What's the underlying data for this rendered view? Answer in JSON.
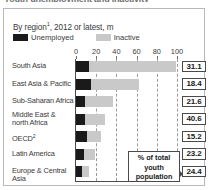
{
  "headline": "Youth unemployment and inactivity",
  "subtitle_prefix": "By region",
  "subtitle_footnote": "1",
  "subtitle_suffix": ", 2012 or latest, m",
  "legend": {
    "unemployed_label": "Unemployed",
    "inactive_label": "Inactive"
  },
  "callout": {
    "line1": "% of total",
    "line2": "youth",
    "line3": "population"
  },
  "colors": {
    "unemployed": "#1a1a1a",
    "inactive": "#c9c9c9",
    "axis": "#4a4a4a",
    "grid": "#9a9a9a",
    "panel_border": "#b9b9b9"
  },
  "chart_data": {
    "type": "bar",
    "orientation": "horizontal",
    "stacked": true,
    "title": "Youth unemployment and inactivity",
    "subtitle": "By region¹, 2012 or latest, m",
    "xlabel": "",
    "ylabel": "",
    "xlim": [
      0,
      100
    ],
    "xticks": [
      0,
      20,
      40,
      60,
      80,
      100
    ],
    "tick_labels": [
      "0",
      "20",
      "40",
      "60",
      "80",
      "100"
    ],
    "grid": true,
    "legend_position": "top-left",
    "categories": [
      "South Asia",
      "East Asia & Pacific",
      "Sub-Saharan Africa",
      "Middle East & north Africa",
      "OECD²",
      "Latin America",
      "Europe & Central Asia"
    ],
    "series": [
      {
        "name": "Unemployed",
        "values": [
          13,
          15,
          9,
          9,
          11,
          8,
          6
        ]
      },
      {
        "name": "Inactive",
        "values": [
          86,
          47,
          28,
          20,
          14,
          11,
          7
        ]
      }
    ],
    "annotation_series": {
      "name": "% of total youth population",
      "values": [
        "31.1",
        "18.4",
        "21.6",
        "40.6",
        "15.2",
        "23.2",
        "24.4"
      ]
    }
  },
  "rows": [
    {
      "label": "South Asia",
      "label2": "",
      "footnote": "",
      "unemployed": 13,
      "inactive": 86,
      "pct": "31.1"
    },
    {
      "label": "East Asia & Pacific",
      "label2": "",
      "footnote": "",
      "unemployed": 15,
      "inactive": 47,
      "pct": "18.4"
    },
    {
      "label": "Sub-Saharan Africa",
      "label2": "",
      "footnote": "",
      "unemployed": 9,
      "inactive": 28,
      "pct": "21.6"
    },
    {
      "label": "Middle East &",
      "label2": "north Africa",
      "footnote": "",
      "unemployed": 9,
      "inactive": 20,
      "pct": "40.6"
    },
    {
      "label": "OECD",
      "label2": "",
      "footnote": "2",
      "unemployed": 11,
      "inactive": 14,
      "pct": "15.2"
    },
    {
      "label": "Latin America",
      "label2": "",
      "footnote": "",
      "unemployed": 8,
      "inactive": 11,
      "pct": "23.2"
    },
    {
      "label": "Europe & Central Asia",
      "label2": "",
      "footnote": "",
      "unemployed": 6,
      "inactive": 7,
      "pct": "24.4"
    }
  ]
}
